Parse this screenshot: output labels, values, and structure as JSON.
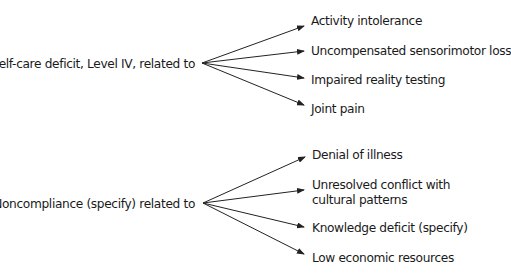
{
  "diagram": {
    "groups": [
      {
        "source": "Self-care deficit, Level IV, related to",
        "targets": [
          "Activity intolerance",
          "Uncompensated sensorimotor loss",
          "Impaired reality testing",
          "Joint pain"
        ]
      },
      {
        "source": "Noncompliance (specify) related to",
        "targets": [
          "Denial of illness",
          "Unresolved conflict with",
          "Knowledge deficit (specify)",
          "Low economic resources"
        ],
        "target_continuation": "cultural patterns"
      }
    ]
  }
}
